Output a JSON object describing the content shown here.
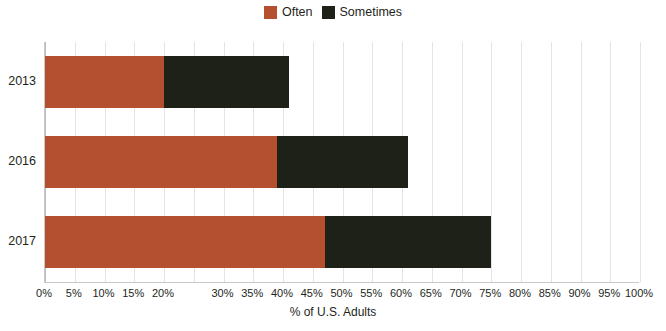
{
  "chart_data": {
    "type": "bar",
    "orientation": "horizontal",
    "stacked": true,
    "title": "",
    "xlabel": "% of U.S. Adults",
    "ylabel": "",
    "xlim": [
      0,
      100
    ],
    "grid": true,
    "legend_position": "top-center",
    "categories": [
      "2013",
      "2016",
      "2017"
    ],
    "series": [
      {
        "name": "Often",
        "color": "#b4502f",
        "values": [
          20,
          39,
          47
        ]
      },
      {
        "name": "Sometimes",
        "color": "#1e2117",
        "values": [
          21,
          22,
          28
        ]
      }
    ],
    "totals": [
      41,
      61,
      75
    ],
    "xtick_values": [
      0,
      5,
      10,
      15,
      20,
      25,
      30,
      35,
      40,
      45,
      50,
      55,
      60,
      65,
      70,
      75,
      80,
      85,
      90,
      95,
      100
    ],
    "xtick_labels": [
      "0%",
      "5%",
      "10%",
      "15%",
      "20%",
      "",
      "30%",
      "35%",
      "40%",
      "45%",
      "50%",
      "55%",
      "60%",
      "65%",
      "70%",
      "75%",
      "80%",
      "85%",
      "90%",
      "95%",
      "100%"
    ]
  },
  "legend": {
    "items": [
      {
        "label": "Often",
        "color": "#b4502f"
      },
      {
        "label": "Sometimes",
        "color": "#1e2117"
      }
    ]
  },
  "axis": {
    "x_title": "% of U.S. Adults"
  }
}
